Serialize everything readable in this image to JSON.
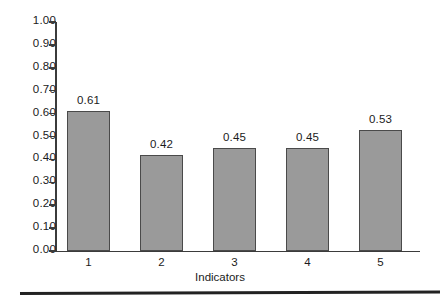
{
  "chart_data": {
    "type": "bar",
    "title": "",
    "xlabel": "Indicators",
    "ylabel": "",
    "categories": [
      "1",
      "2",
      "3",
      "4",
      "5"
    ],
    "values": [
      0.61,
      0.42,
      0.45,
      0.45,
      0.53
    ],
    "value_labels": [
      "0.61",
      "0.42",
      "0.45",
      "0.45",
      "0.53"
    ],
    "ylim": [
      0.0,
      1.0
    ],
    "ytick_labels": [
      "0.00",
      "0.10",
      "0.20",
      "0.30",
      "0.40",
      "0.50",
      "0.60",
      "0.70",
      "0.80",
      "0.90",
      "1.00"
    ],
    "ytick_values": [
      0.0,
      0.1,
      0.2,
      0.3,
      0.4,
      0.5,
      0.6,
      0.7,
      0.8,
      0.9,
      1.0
    ],
    "grid": false,
    "legend": null,
    "bar_color": "#9a9a9a",
    "bar_edge_color": "#4a4a4a",
    "axis_color": "#3b3b3b",
    "background_color": "#ffffff"
  }
}
